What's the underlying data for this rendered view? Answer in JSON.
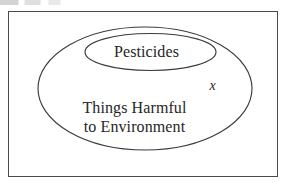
{
  "figure": {
    "type": "euler-diagram",
    "frame": {
      "border_color": "#4a4a4a",
      "background_color": "#ffffff"
    },
    "stroke_color": "#3b3b3b",
    "text_color": "#262626"
  },
  "sets": {
    "outer": {
      "name": "things-harmful-to-environment",
      "label_line_1": "Things Harmful",
      "label_line_2": "to Environment",
      "shape": "ellipse"
    },
    "inner": {
      "name": "pesticides",
      "label": "Pesticides",
      "shape": "ellipse"
    }
  },
  "elements": [
    {
      "name": "element-x",
      "label": "x",
      "style": "italic",
      "region": "inside-outer-ellipse-outside-inner-ellipse"
    }
  ]
}
